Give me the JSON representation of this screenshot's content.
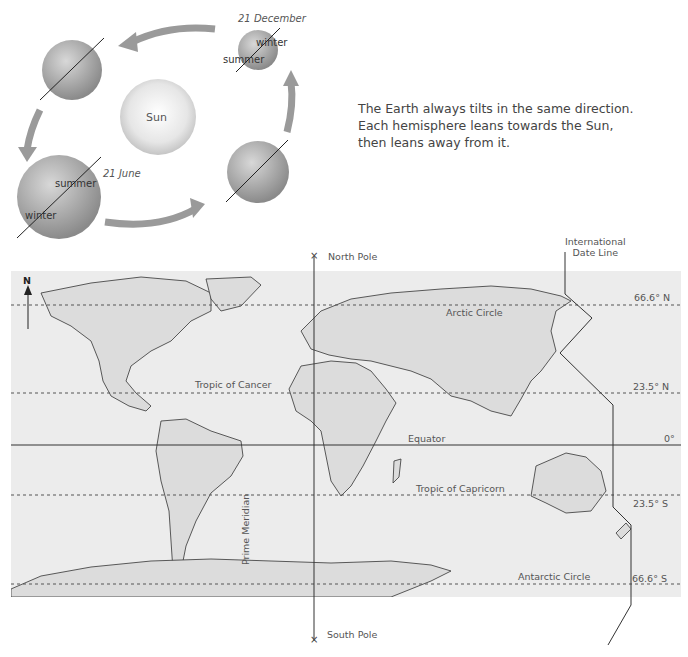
{
  "orbit_diagram": {
    "sun_label": "Sun",
    "dates": {
      "december": "21 December",
      "june": "21 June"
    },
    "december_earth": {
      "upper": "winter",
      "lower": "summer"
    },
    "june_earth": {
      "upper": "summer",
      "lower": "winter"
    },
    "description": [
      "The Earth always tilts in the same direction.",
      "Each hemisphere leans towards the Sun,",
      "then leans away from it."
    ]
  },
  "world_map": {
    "north_arrow": "N",
    "north_pole": "North Pole",
    "south_pole": "South Pole",
    "prime_meridian": "Prime Meridian",
    "date_line": [
      "International",
      "Date Line"
    ],
    "lines": [
      {
        "name": "Arctic Circle",
        "latitude": "66.6° N",
        "style": "dashed"
      },
      {
        "name": "Tropic of Cancer",
        "latitude": "23.5° N",
        "style": "dashed"
      },
      {
        "name": "Equator",
        "latitude": "0°",
        "style": "solid"
      },
      {
        "name": "Tropic of Capricorn",
        "latitude": "23.5° S",
        "style": "dashed"
      },
      {
        "name": "Antarctic Circle",
        "latitude": "66.6° S",
        "style": "dashed"
      }
    ],
    "colors": {
      "ocean": "#ececec",
      "land": "#d9d9d9",
      "outline": "#333333"
    }
  }
}
